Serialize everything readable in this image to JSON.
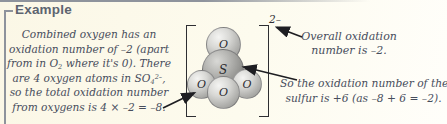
{
  "box": {
    "title": "Example"
  },
  "left_note": {
    "lines": [
      [
        {
          "t": "txt",
          "v": "Combined oxygen has an"
        }
      ],
      [
        {
          "t": "txt",
          "v": "oxidation number of –2 (apart"
        }
      ],
      [
        {
          "t": "txt",
          "v": "from in O"
        },
        {
          "t": "sub",
          "v": "2"
        },
        {
          "t": "txt",
          "v": " where it's 0). There"
        }
      ],
      [
        {
          "t": "txt",
          "v": "are 4 oxygen atoms in SO"
        },
        {
          "t": "sub",
          "v": "4"
        },
        {
          "t": "sup",
          "v": "2–"
        },
        {
          "t": "txt",
          "v": ","
        }
      ],
      [
        {
          "t": "txt",
          "v": "so the total oxidation number"
        }
      ],
      [
        {
          "t": "txt",
          "v": "from oxygens is 4 × –2 = –8."
        }
      ]
    ]
  },
  "molecule": {
    "name": "sulfate-ion-ball-model",
    "charge": "2–",
    "atoms": [
      {
        "label": "O",
        "position": "top"
      },
      {
        "label": "S",
        "position": "center"
      },
      {
        "label": "O",
        "position": "left"
      },
      {
        "label": "O",
        "position": "right"
      },
      {
        "label": "O",
        "position": "front"
      }
    ]
  },
  "right_notes": {
    "overall": [
      "Overall oxidation",
      "number is –2."
    ],
    "sulfur": [
      "So the oxidation number of the",
      "sulfur is +6 (as –8 + 6 = –2)."
    ]
  },
  "colors": {
    "background": "#fdfaec",
    "frame": "#8e939c",
    "title": "#5d6470",
    "text": "#474d5c",
    "arrow": "#1e1e22",
    "sphere_oxygen": "#c9c9c6",
    "sphere_sulfur": "#8a8a87"
  }
}
